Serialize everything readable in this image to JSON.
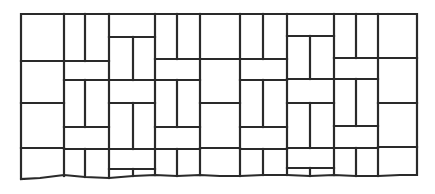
{
  "figure": {
    "description": "Line drawing of a basketweave brick paving pattern",
    "pattern_name": "basketweave",
    "stroke_color": "#2a2a2a",
    "background_color": "#ffffff",
    "outline": {
      "left": 21,
      "right": 417,
      "top": 14
    },
    "bottom_edge": [
      [
        21,
        179
      ],
      [
        40,
        178
      ],
      [
        64,
        175
      ],
      [
        85,
        177
      ],
      [
        109,
        178
      ],
      [
        133,
        176
      ],
      [
        155,
        175
      ],
      [
        177,
        176
      ],
      [
        200,
        175
      ],
      [
        220,
        176
      ],
      [
        240,
        176
      ],
      [
        263,
        175
      ],
      [
        287,
        175
      ],
      [
        310,
        176
      ],
      [
        334,
        175
      ],
      [
        356,
        176
      ],
      [
        378,
        176
      ],
      [
        400,
        175
      ],
      [
        417,
        175
      ]
    ],
    "lines": [
      [
        21,
        61,
        62,
        61
      ],
      [
        21,
        103,
        64,
        103
      ],
      [
        21,
        148,
        64,
        148
      ],
      [
        85,
        14,
        85,
        61
      ],
      [
        64,
        61,
        109,
        61
      ],
      [
        64,
        80,
        109,
        80
      ],
      [
        85,
        80,
        85,
        127
      ],
      [
        64,
        127,
        109,
        127
      ],
      [
        64,
        149,
        109,
        149
      ],
      [
        85,
        149,
        85,
        177
      ],
      [
        109,
        37,
        155,
        37
      ],
      [
        133,
        37,
        133,
        80
      ],
      [
        109,
        80,
        155,
        80
      ],
      [
        109,
        103,
        155,
        103
      ],
      [
        133,
        103,
        133,
        149
      ],
      [
        109,
        149,
        155,
        149
      ],
      [
        109,
        169,
        155,
        169
      ],
      [
        133,
        169,
        133,
        176
      ],
      [
        177,
        14,
        177,
        59
      ],
      [
        155,
        59,
        200,
        59
      ],
      [
        155,
        80,
        200,
        80
      ],
      [
        177,
        80,
        177,
        127
      ],
      [
        155,
        127,
        200,
        127
      ],
      [
        155,
        149,
        200,
        149
      ],
      [
        177,
        149,
        177,
        176
      ],
      [
        200,
        59,
        240,
        59
      ],
      [
        200,
        103,
        240,
        103
      ],
      [
        200,
        148,
        240,
        148
      ],
      [
        263,
        14,
        263,
        59
      ],
      [
        240,
        59,
        287,
        59
      ],
      [
        240,
        80,
        287,
        80
      ],
      [
        263,
        80,
        263,
        127
      ],
      [
        240,
        127,
        287,
        127
      ],
      [
        240,
        149,
        287,
        149
      ],
      [
        263,
        149,
        263,
        175
      ],
      [
        287,
        36,
        334,
        36
      ],
      [
        310,
        36,
        310,
        79
      ],
      [
        287,
        79,
        334,
        79
      ],
      [
        287,
        103,
        334,
        103
      ],
      [
        310,
        103,
        310,
        148
      ],
      [
        287,
        148,
        334,
        148
      ],
      [
        287,
        168,
        334,
        168
      ],
      [
        310,
        168,
        310,
        176
      ],
      [
        356,
        14,
        356,
        58
      ],
      [
        334,
        58,
        378,
        58
      ],
      [
        334,
        79,
        378,
        79
      ],
      [
        356,
        79,
        356,
        126
      ],
      [
        334,
        126,
        378,
        126
      ],
      [
        334,
        148,
        378,
        148
      ],
      [
        356,
        148,
        356,
        176
      ],
      [
        378,
        58,
        417,
        58
      ],
      [
        378,
        103,
        417,
        103
      ],
      [
        378,
        147,
        417,
        147
      ],
      [
        64,
        14,
        64,
        176
      ],
      [
        109,
        14,
        109,
        178
      ],
      [
        155,
        14,
        155,
        175
      ],
      [
        200,
        14,
        200,
        175
      ],
      [
        240,
        14,
        240,
        176
      ],
      [
        287,
        14,
        287,
        175
      ],
      [
        334,
        14,
        334,
        175
      ],
      [
        378,
        14,
        378,
        176
      ]
    ]
  }
}
